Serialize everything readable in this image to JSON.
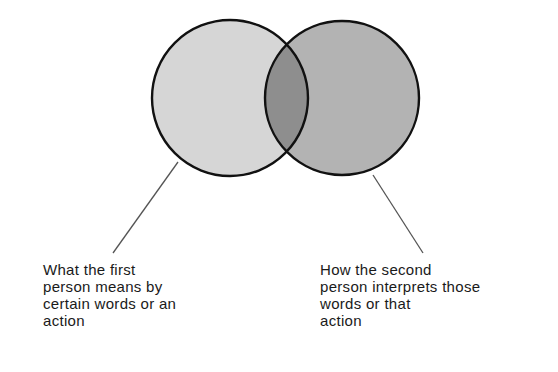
{
  "diagram": {
    "type": "venn",
    "colors": {
      "background": "#ffffff",
      "left_circle_fill": "#d6d6d6",
      "right_circle_fill": "#b3b3b3",
      "overlap_fill": "#8e8e8e",
      "stroke": "#111111",
      "leader_line": "#555555",
      "text": "#1a1a1a"
    },
    "circles": [
      {
        "id": "first-person",
        "cx": 230,
        "cy": 98,
        "r": 78
      },
      {
        "id": "second-person",
        "cx": 342,
        "cy": 98,
        "r": 77
      }
    ],
    "leader_lines": [
      {
        "id": "left",
        "x1": 178,
        "y1": 162,
        "x2": 113,
        "y2": 253
      },
      {
        "id": "right",
        "x1": 373,
        "y1": 175,
        "x2": 423,
        "y2": 253
      }
    ]
  },
  "captions": {
    "left": {
      "lines": [
        "What the first",
        "person means by",
        "certain words or an",
        "action"
      ]
    },
    "right": {
      "lines": [
        "How the second",
        "person interprets those",
        "words or that",
        "action"
      ]
    }
  }
}
